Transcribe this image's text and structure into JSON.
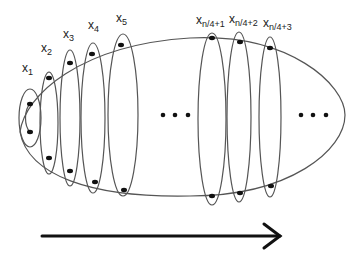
{
  "diagram": {
    "labels": [
      {
        "id": "x1",
        "base": "x",
        "sub": "1",
        "x": 18,
        "y": 72
      },
      {
        "id": "x2",
        "base": "x",
        "sub": "2",
        "x": 40,
        "y": 52
      },
      {
        "id": "x3",
        "base": "x",
        "sub": "3",
        "x": 63,
        "y": 39
      },
      {
        "id": "x4",
        "base": "x",
        "sub": "4",
        "x": 87,
        "y": 29
      },
      {
        "id": "x5",
        "base": "x",
        "sub": "5",
        "x": 115,
        "y": 22
      },
      {
        "id": "xn4p1",
        "base": "x",
        "sub": "n/4+1",
        "x": 196,
        "y": 22
      },
      {
        "id": "xn4p2",
        "base": "x",
        "sub": "n/4+2",
        "x": 229,
        "y": 22
      },
      {
        "id": "xn4p3",
        "base": "x",
        "sub": "n/4+3",
        "x": 263,
        "y": 26
      }
    ],
    "ellipsis_middle": "• • •",
    "ellipsis_right": "• • •",
    "arrow": {
      "direction": "right",
      "x1": 42,
      "x2": 280,
      "y": 236
    },
    "colors": {
      "stroke": "#555555",
      "dot": "#111111",
      "arrow": "#111111"
    }
  }
}
